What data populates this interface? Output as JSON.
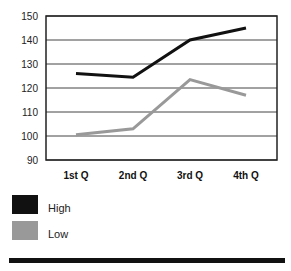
{
  "chart_data": {
    "type": "line",
    "title": "",
    "xlabel": "",
    "ylabel": "",
    "categories": [
      "1st Q",
      "2nd Q",
      "3rd Q",
      "4th Q"
    ],
    "series": [
      {
        "name": "High",
        "color": "#111111",
        "values": [
          126,
          124.5,
          140,
          145
        ]
      },
      {
        "name": "Low",
        "color": "#999999",
        "values": [
          100.5,
          103,
          123.5,
          117
        ]
      }
    ],
    "ylim": [
      90,
      150
    ],
    "yticks": [
      90,
      100,
      110,
      120,
      130,
      140,
      150
    ],
    "grid": true,
    "legend_position": "bottom-left"
  },
  "legend": {
    "items": [
      {
        "label": "High",
        "color": "#111111"
      },
      {
        "label": "Low",
        "color": "#999999"
      }
    ]
  }
}
